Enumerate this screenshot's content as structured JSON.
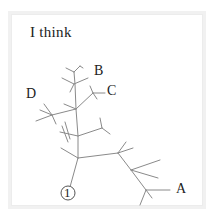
{
  "diagram": {
    "title": "I think",
    "root_label": "1",
    "leaf_labels": {
      "A": "A",
      "B": "B",
      "C": "C",
      "D": "D"
    },
    "line_color": "#8a8a8a",
    "text_color": "#222222"
  }
}
